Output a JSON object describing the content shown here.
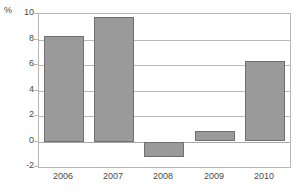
{
  "chart_data": {
    "type": "bar",
    "title": "",
    "xlabel": "",
    "ylabel": "%",
    "unit_label": "%",
    "categories": [
      "2006",
      "2007",
      "2008",
      "2009",
      "2010"
    ],
    "values": [
      8.3,
      9.8,
      -1.2,
      0.8,
      6.3
    ],
    "ylim": [
      -2,
      10
    ],
    "yticks": [
      10,
      8,
      6,
      4,
      2,
      0,
      -2
    ],
    "ytick_labels": [
      "10",
      "8",
      "6",
      "4",
      "2",
      "0",
      "-2"
    ],
    "grid": true,
    "legend": "none",
    "series": [
      {
        "name": "",
        "values": [
          8.3,
          9.8,
          -1.2,
          0.8,
          6.3
        ]
      }
    ],
    "colors": {
      "bar_fill": "#9a9a9a",
      "bar_border": "#6f6f6f",
      "gridline": "#b9b9b9",
      "frame": "#b6b6b6",
      "text": "#4a4a4a",
      "background": "#ffffff"
    }
  }
}
